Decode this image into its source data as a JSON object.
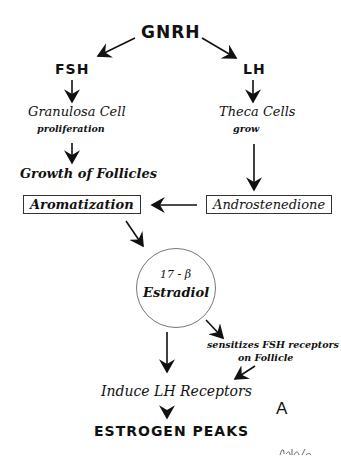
{
  "diagram": {
    "top": "GNRH",
    "left_branch": {
      "hormone": "FSH",
      "step1_title": "Granulosa Cell",
      "step1_sub": "proliferation",
      "step2": "Growth of Follicles",
      "box": "Aromatization"
    },
    "right_branch": {
      "hormone": "LH",
      "step1_title": "Theca Cells",
      "step1_sub": "grow",
      "box": "Androstenedione"
    },
    "center": {
      "line1": "17 - β",
      "line2": "Estradiol"
    },
    "side_note_line1": "sensitizes FSH receptors",
    "side_note_line2": "on Follicle",
    "induce": "Induce LH Receptors",
    "result": "ESTROGEN PEAKS",
    "panel_label": "A"
  }
}
